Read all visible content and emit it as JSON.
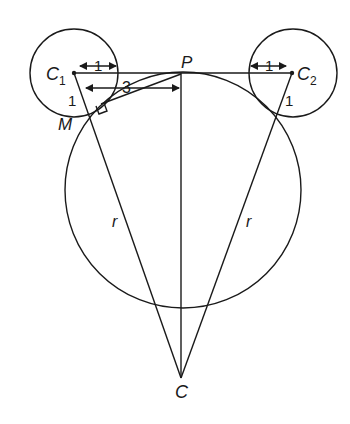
{
  "diagram": {
    "stroke_color": "#1a1a1a",
    "background": "#ffffff",
    "points": {
      "C1": {
        "label": "C",
        "sub": "1",
        "x": 74,
        "y": 73
      },
      "C2": {
        "label": "C",
        "sub": "2",
        "x": 292,
        "y": 73
      },
      "P": {
        "label": "P",
        "x": 181,
        "y": 74
      },
      "C": {
        "label": "C",
        "x": 181,
        "y": 378
      },
      "M": {
        "label": "M",
        "x": 101,
        "y": 104
      }
    },
    "circles": [
      {
        "name": "small-circle-c1",
        "cx": 74,
        "cy": 73,
        "r": 44
      },
      {
        "name": "small-circle-c2",
        "cx": 293,
        "cy": 73,
        "r": 44
      },
      {
        "name": "big-circle",
        "cx": 183,
        "cy": 190,
        "r": 119
      }
    ],
    "labels": {
      "c1_radius_top": "1",
      "c2_radius_top": "1",
      "c1_radius_side": "1",
      "c2_radius_side": "1",
      "distance_3": "3",
      "r_left": "r",
      "r_right": "r"
    }
  }
}
